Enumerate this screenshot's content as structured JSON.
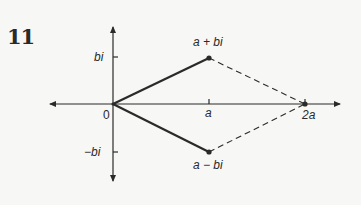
{
  "figure": {
    "number": "11",
    "labels": {
      "origin": "0",
      "y_pos": "bi",
      "y_neg": "−bi",
      "x_a": "a",
      "x_2a": "2a",
      "point_upper": "a + bi",
      "point_lower": "a − bi"
    },
    "colors": {
      "ink": "#2a2a2a",
      "background": "#f7f7f5"
    }
  }
}
